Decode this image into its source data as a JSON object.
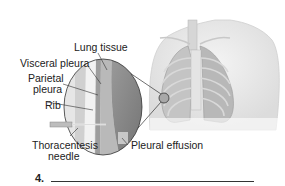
{
  "figure": {
    "labels": {
      "lung_tissue": "Lung tissue",
      "visceral_pleura": "Visceral pleura",
      "parietal_pleura_1": "Parietal",
      "parietal_pleura_2": "pleura",
      "rib": "Rib",
      "thoracentesis_1": "Thoracentesis",
      "thoracentesis_2": "needle",
      "pleural_effusion": "Pleural effusion"
    }
  },
  "question": {
    "number": "4."
  },
  "colors": {
    "label_text": "#222222",
    "leader_line": "#333333",
    "torso_fill": "#e8e8e8",
    "lung_tissue_fill": "#8a8a8a",
    "effusion_fill": "#b9b9b9"
  }
}
